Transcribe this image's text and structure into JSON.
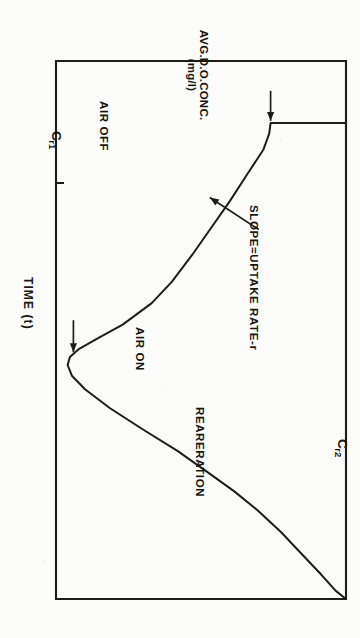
{
  "figure": {
    "rotation_degrees": 90,
    "ink_color": "#1c1c18",
    "paper_color": "#fbfbfa"
  },
  "axes": {
    "y_label_line1": "AVG.D.O.CONC.",
    "y_label_line2": "(mg/l)",
    "x_label": "TIME (t)",
    "tick_cr1_symbol": "C",
    "tick_cr1_subscript": "r1",
    "tick_cr2_symbol": "C",
    "tick_cr2_subscript": "r2"
  },
  "annotations": {
    "air_off": "AIR OFF",
    "air_on": "AIR ON",
    "slope": "SLOPE=UPTAKE RATE-r",
    "reaeration": "REARERATION"
  },
  "chart_data": {
    "type": "line",
    "title": "",
    "subtitle": "",
    "xlabel": "TIME (t)",
    "ylabel": "AVG.D.O.CONC. (mg/l)",
    "xlim": [
      0,
      1
    ],
    "ylim": [
      0,
      1
    ],
    "grid": false,
    "legend": null,
    "axis_tick_labels": {
      "y": [
        "Cr1",
        "Cr2"
      ],
      "x": []
    },
    "annotations": [
      {
        "text": "AIR OFF",
        "target_x": 0.115,
        "target_y": 0.74,
        "note": "arrow points to the start of the depletion segment where aeration stops"
      },
      {
        "text": "SLOPE=UPTAKE RATE-r",
        "target_x": 0.25,
        "target_y": 0.52,
        "note": "arrow points at the straight descending segment"
      },
      {
        "text": "AIR ON",
        "target_x": 0.545,
        "target_y": 0.06,
        "note": "arrow points at the minimum of the curve where aeration restarts"
      },
      {
        "text": "REARERATION",
        "target_x": 0.75,
        "target_y": 0.62,
        "note": "label along the rising recovery limb"
      }
    ],
    "series": [
      {
        "name": "Average dissolved oxygen concentration",
        "x": [
          0.115,
          0.115,
          0.135,
          0.165,
          0.21,
          0.26,
          0.31,
          0.36,
          0.41,
          0.45,
          0.49,
          0.515,
          0.535,
          0.55,
          0.565,
          0.585,
          0.61,
          0.645,
          0.685,
          0.725,
          0.765,
          0.8,
          0.835,
          0.875,
          0.915,
          0.955,
          0.985,
          1.0
        ],
        "y": [
          1.0,
          0.74,
          0.735,
          0.715,
          0.66,
          0.6,
          0.535,
          0.47,
          0.4,
          0.33,
          0.23,
          0.145,
          0.08,
          0.048,
          0.04,
          0.055,
          0.1,
          0.185,
          0.3,
          0.42,
          0.525,
          0.615,
          0.695,
          0.775,
          0.845,
          0.915,
          0.965,
          1.0
        ],
        "description": "Vertical drop at AIR OFF, near-linear oxygen uptake, minimum at AIR ON, then reaeration rise to saturation Cr2"
      }
    ]
  }
}
